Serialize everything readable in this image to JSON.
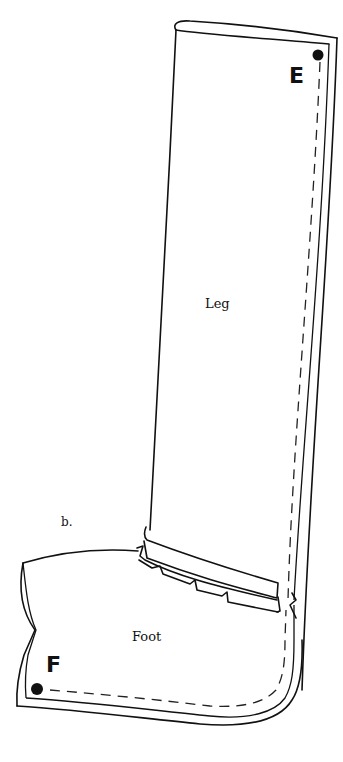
{
  "diagram": {
    "figure_label": "b.",
    "pieces": [
      {
        "name": "Leg",
        "label": "Leg"
      },
      {
        "name": "Foot",
        "label": "Foot"
      }
    ],
    "points": [
      {
        "label": "E",
        "marker": "dot"
      },
      {
        "label": "F",
        "marker": "dot"
      }
    ],
    "colors": {
      "line": "#111111",
      "background": "#ffffff"
    }
  }
}
